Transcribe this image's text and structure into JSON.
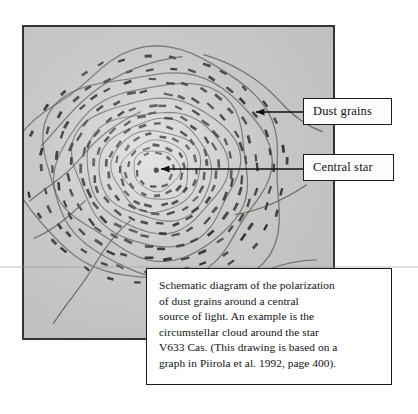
{
  "figure": {
    "kind": "schematic-diagram",
    "panel_background_color": "#c9c9c7",
    "ink_color": "#2b2b28"
  },
  "callouts": [
    {
      "id": "dust-grains",
      "label": "Dust grains",
      "arrow_points_to": "dash-field-upper-right"
    },
    {
      "id": "central-star",
      "label": "Central star",
      "arrow_points_to": "star-dot-center"
    }
  ],
  "caption": {
    "text": "Schematic diagram of the polarization\nof dust grains around a central\nsource of light.  An example is the\ncircumstellar cloud around the star\nV633 Cas.  (This drawing is based on a\ngraph in Piirola et al. 1992, page 400)."
  },
  "chart_data": {
    "type": "scatter",
    "title": "Schematic diagram of the polarization of dust grains around a central source of light",
    "xlabel": "",
    "ylabel": "",
    "star": {
      "x": 156,
      "y": 170,
      "label": "Central star"
    },
    "shells": [
      {
        "radius": 18,
        "count": 10,
        "dash_length": 6.0
      },
      {
        "radius": 27,
        "count": 14,
        "dash_length": 6.5
      },
      {
        "radius": 37,
        "count": 18,
        "dash_length": 7.0
      },
      {
        "radius": 48,
        "count": 22,
        "dash_length": 7.5
      },
      {
        "radius": 59,
        "count": 26,
        "dash_length": 8.0
      },
      {
        "radius": 71,
        "count": 30,
        "dash_length": 8.5
      },
      {
        "radius": 84,
        "count": 32,
        "dash_length": 8.5
      },
      {
        "radius": 97,
        "count": 34,
        "dash_length": 8.0
      },
      {
        "radius": 110,
        "count": 34,
        "dash_length": 7.5
      },
      {
        "radius": 124,
        "count": 32,
        "dash_length": 7.0
      }
    ],
    "contours": [
      {
        "radius": 22,
        "wobble": 1.5
      },
      {
        "radius": 32,
        "wobble": 2.0
      },
      {
        "radius": 43,
        "wobble": 2.5
      },
      {
        "radius": 54,
        "wobble": 3.0
      },
      {
        "radius": 66,
        "wobble": 4.0
      },
      {
        "radius": 79,
        "wobble": 5.5
      },
      {
        "radius": 93,
        "wobble": 7.0
      },
      {
        "radius": 108,
        "wobble": 9.0
      },
      {
        "radius": 126,
        "wobble": 12.0
      }
    ]
  }
}
